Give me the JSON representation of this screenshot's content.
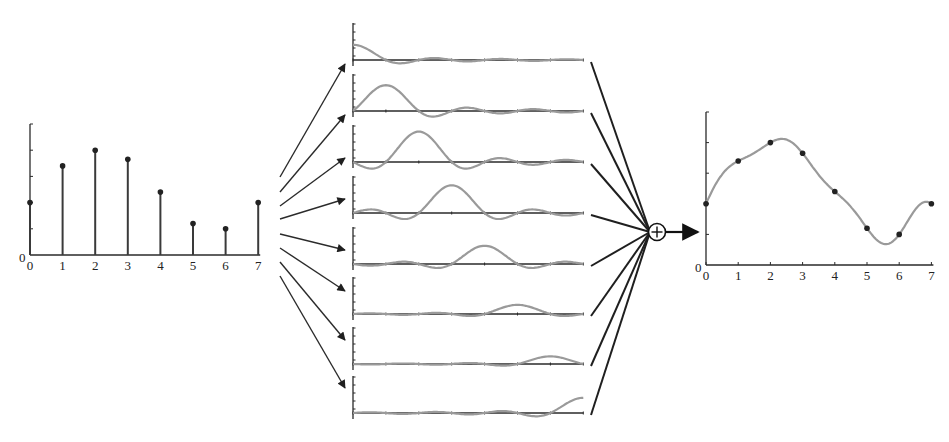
{
  "left_plot": {
    "y_origin_label": "0",
    "x_tick_labels": [
      "0",
      "1",
      "2",
      "3",
      "4",
      "5",
      "6",
      "7"
    ]
  },
  "right_plot": {
    "y_origin_label": "0",
    "x_tick_labels": [
      "0",
      "1",
      "2",
      "3",
      "4",
      "5",
      "6",
      "7"
    ]
  },
  "sum_node": {
    "symbol": "+"
  },
  "colors": {
    "stem": "#3a3a3a",
    "curve": "#9a9a9a",
    "axis": "#2a2a2a",
    "arrow": "#2b2b2b"
  },
  "chart_data": [
    {
      "type": "stem",
      "title": "Discrete samples x[n]",
      "xlabel": "",
      "ylabel": "",
      "categories": [
        0,
        1,
        2,
        3,
        4,
        5,
        6,
        7
      ],
      "values": [
        2.0,
        3.4,
        4.0,
        3.65,
        2.4,
        1.2,
        1.0,
        2.0
      ],
      "ylim": [
        0,
        5
      ],
      "y_ticks": [
        1,
        2,
        3,
        4,
        5
      ],
      "grid": false
    },
    {
      "type": "line",
      "title": "Shifted, scaled sinc kernels x[n]·sinc(t−n)",
      "series": [
        {
          "name": "n=0",
          "shift": 0,
          "amplitude": 2.0
        },
        {
          "name": "n=1",
          "shift": 1,
          "amplitude": 3.4
        },
        {
          "name": "n=2",
          "shift": 2,
          "amplitude": 4.0
        },
        {
          "name": "n=3",
          "shift": 3,
          "amplitude": 3.65
        },
        {
          "name": "n=4",
          "shift": 4,
          "amplitude": 2.4
        },
        {
          "name": "n=5",
          "shift": 5,
          "amplitude": 1.2
        },
        {
          "name": "n=6",
          "shift": 6,
          "amplitude": 1.0
        },
        {
          "name": "n=7",
          "shift": 7,
          "amplitude": 2.0
        }
      ],
      "x_range": [
        0,
        7
      ]
    },
    {
      "type": "line",
      "title": "Reconstructed continuous signal x(t) = Σ x[n]·sinc(t−n)",
      "x": [
        0,
        1,
        2,
        3,
        4,
        5,
        6,
        7
      ],
      "sample_points": [
        2.0,
        3.4,
        4.0,
        3.65,
        2.4,
        1.2,
        1.0,
        2.0
      ],
      "ylim": [
        0,
        5
      ],
      "y_ticks": [
        1,
        2,
        3,
        4,
        5
      ],
      "grid": false
    }
  ]
}
